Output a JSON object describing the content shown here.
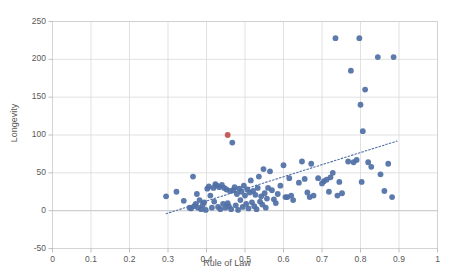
{
  "chart_data": {
    "type": "scatter",
    "title": "",
    "xlabel": "Rule of Law",
    "ylabel": "Longevity",
    "xlim": [
      0,
      1
    ],
    "ylim": [
      -50,
      250
    ],
    "xticks": [
      "0",
      "0.1",
      "0.2",
      "0.3",
      "0.4",
      "0.5",
      "0.6",
      "0.7",
      "0.8",
      "0.9",
      "1"
    ],
    "xtick_values": [
      0,
      0.1,
      0.2,
      0.3,
      0.4,
      0.5,
      0.6,
      0.7,
      0.8,
      0.9,
      1
    ],
    "yticks": [
      "-50",
      "0",
      "50",
      "100",
      "150",
      "200",
      "250"
    ],
    "ytick_values": [
      -50,
      0,
      50,
      100,
      150,
      200,
      250
    ],
    "grid": true,
    "grid_color": "#d9d9d9",
    "legend": "none",
    "marker_color": "#4f6fa5",
    "highlight_marker_color": "#c0504d",
    "trendline": {
      "type": "linear-dotted",
      "color": "#4f6fa5",
      "x0": 0.295,
      "y0": -4,
      "x1": 0.895,
      "y1": 92
    },
    "series": [
      {
        "name": "countries",
        "marker": "circle",
        "color": "#4f6fa5",
        "points": [
          [
            0.295,
            19
          ],
          [
            0.322,
            25
          ],
          [
            0.341,
            13
          ],
          [
            0.356,
            4
          ],
          [
            0.36,
            3
          ],
          [
            0.365,
            45
          ],
          [
            0.368,
            6
          ],
          [
            0.372,
            9
          ],
          [
            0.375,
            22
          ],
          [
            0.378,
            4
          ],
          [
            0.382,
            14
          ],
          [
            0.386,
            2
          ],
          [
            0.39,
            7
          ],
          [
            0.394,
            11
          ],
          [
            0.398,
            1
          ],
          [
            0.402,
            29
          ],
          [
            0.406,
            32
          ],
          [
            0.41,
            20
          ],
          [
            0.414,
            4
          ],
          [
            0.418,
            30
          ],
          [
            0.42,
            12
          ],
          [
            0.423,
            35
          ],
          [
            0.427,
            33
          ],
          [
            0.43,
            5
          ],
          [
            0.433,
            31
          ],
          [
            0.436,
            2
          ],
          [
            0.44,
            34
          ],
          [
            0.443,
            9
          ],
          [
            0.446,
            30
          ],
          [
            0.449,
            4
          ],
          [
            0.452,
            28
          ],
          [
            0.455,
            10
          ],
          [
            0.458,
            6
          ],
          [
            0.461,
            26
          ],
          [
            0.464,
            2
          ],
          [
            0.467,
            90
          ],
          [
            0.47,
            27
          ],
          [
            0.473,
            31
          ],
          [
            0.476,
            7
          ],
          [
            0.479,
            22
          ],
          [
            0.482,
            1
          ],
          [
            0.485,
            29
          ],
          [
            0.488,
            14
          ],
          [
            0.491,
            25
          ],
          [
            0.494,
            5
          ],
          [
            0.497,
            33
          ],
          [
            0.5,
            20
          ],
          [
            0.503,
            9
          ],
          [
            0.506,
            28
          ],
          [
            0.509,
            3
          ],
          [
            0.512,
            24
          ],
          [
            0.515,
            40
          ],
          [
            0.518,
            11
          ],
          [
            0.521,
            26
          ],
          [
            0.524,
            6
          ],
          [
            0.527,
            21
          ],
          [
            0.53,
            2
          ],
          [
            0.533,
            30
          ],
          [
            0.536,
            45
          ],
          [
            0.539,
            12
          ],
          [
            0.542,
            19
          ],
          [
            0.545,
            8
          ],
          [
            0.548,
            55
          ],
          [
            0.551,
            23
          ],
          [
            0.554,
            4
          ],
          [
            0.557,
            16
          ],
          [
            0.56,
            30
          ],
          [
            0.565,
            52
          ],
          [
            0.57,
            27
          ],
          [
            0.575,
            15
          ],
          [
            0.58,
            10
          ],
          [
            0.585,
            22
          ],
          [
            0.592,
            33
          ],
          [
            0.6,
            60
          ],
          [
            0.605,
            18
          ],
          [
            0.61,
            18
          ],
          [
            0.615,
            43
          ],
          [
            0.62,
            20
          ],
          [
            0.625,
            14
          ],
          [
            0.64,
            37
          ],
          [
            0.648,
            65
          ],
          [
            0.655,
            42
          ],
          [
            0.662,
            24
          ],
          [
            0.668,
            18
          ],
          [
            0.672,
            62
          ],
          [
            0.678,
            20
          ],
          [
            0.69,
            43
          ],
          [
            0.7,
            36
          ],
          [
            0.705,
            39
          ],
          [
            0.712,
            41
          ],
          [
            0.718,
            25
          ],
          [
            0.722,
            44
          ],
          [
            0.728,
            50
          ],
          [
            0.735,
            228
          ],
          [
            0.74,
            20
          ],
          [
            0.745,
            38
          ],
          [
            0.752,
            23
          ],
          [
            0.768,
            65
          ],
          [
            0.775,
            185
          ],
          [
            0.782,
            64
          ],
          [
            0.79,
            67
          ],
          [
            0.797,
            228
          ],
          [
            0.8,
            140
          ],
          [
            0.803,
            38
          ],
          [
            0.806,
            105
          ],
          [
            0.812,
            160
          ],
          [
            0.82,
            64
          ],
          [
            0.828,
            58
          ],
          [
            0.845,
            203
          ],
          [
            0.852,
            48
          ],
          [
            0.862,
            26
          ],
          [
            0.872,
            62
          ],
          [
            0.882,
            18
          ],
          [
            0.886,
            203
          ]
        ]
      },
      {
        "name": "highlighted",
        "marker": "circle",
        "color": "#c0504d",
        "points": [
          [
            0.455,
            100
          ]
        ]
      }
    ]
  }
}
